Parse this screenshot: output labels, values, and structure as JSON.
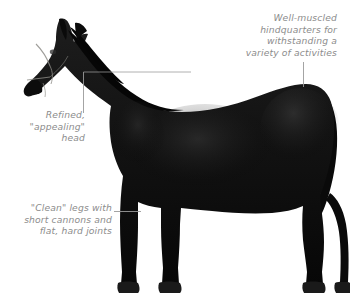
{
  "figure": {
    "background_color": "#ffffff",
    "horse_color": "#111111",
    "annotation_color": "#8c8c8c",
    "leader_line_color": "#9a9a9a"
  },
  "annotations": {
    "hindquarters": {
      "name": "hindquarters-annotation",
      "lines": [
        "Well-muscled",
        "hindquarters for",
        "withstanding a",
        "variety of activities"
      ]
    },
    "head": {
      "name": "head-annotation",
      "lines": [
        "Refined,",
        "\"appealing\"",
        "head"
      ]
    },
    "legs": {
      "name": "legs-annotation",
      "lines": [
        "\"Clean\" legs with",
        "short cannons and",
        "flat, hard joints"
      ]
    }
  }
}
